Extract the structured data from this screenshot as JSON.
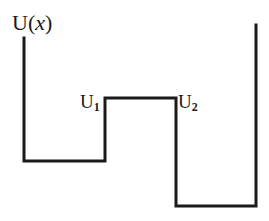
{
  "diagram": {
    "axis_label": {
      "prefix": "U(",
      "variable": "x",
      "suffix": ")"
    },
    "levels": [
      {
        "name": "U",
        "subscript": "1"
      },
      {
        "name": "U",
        "subscript": "2"
      }
    ],
    "line_color": "#1a1a1a",
    "line_width": 3,
    "path_points": [
      [
        24,
        38
      ],
      [
        24,
        161
      ],
      [
        105,
        161
      ],
      [
        105,
        98
      ],
      [
        176,
        98
      ],
      [
        176,
        206
      ],
      [
        256,
        206
      ],
      [
        256,
        25
      ]
    ]
  }
}
